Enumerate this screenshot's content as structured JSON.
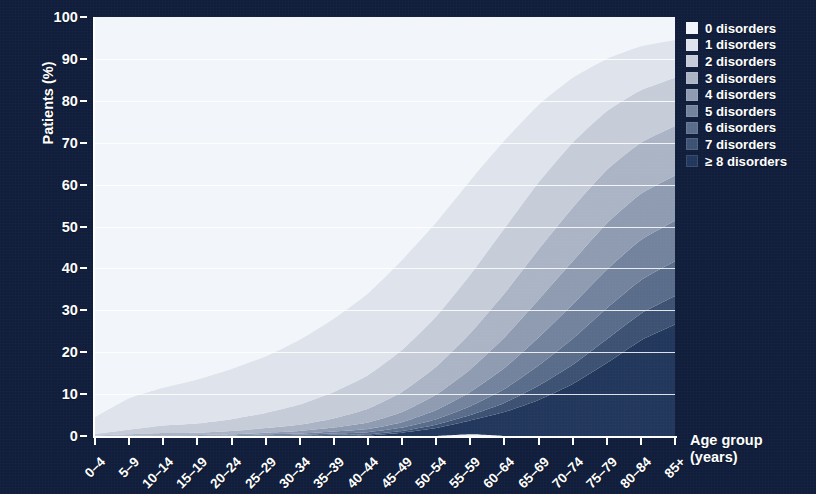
{
  "figure": {
    "background_color": "#101e3c",
    "plot_background": "#eef1f6",
    "axis_color": "#ffffff"
  },
  "axes": {
    "y_title": "Patients (%)",
    "x_title_line1": "Age group",
    "x_title_line2": "(years)",
    "y_ticks": [
      "0",
      "10",
      "20",
      "30",
      "40",
      "50",
      "60",
      "70",
      "80",
      "90",
      "100"
    ]
  },
  "legend": {
    "items": [
      {
        "label": "0 disorders",
        "color": "#f2f5f9"
      },
      {
        "label": "1 disorders",
        "color": "#dfe4ec"
      },
      {
        "label": "2 disorders",
        "color": "#c6ccd8"
      },
      {
        "label": "3 disorders",
        "color": "#aab4c5"
      },
      {
        "label": "4 disorders",
        "color": "#8e9bb1"
      },
      {
        "label": "5 disorders",
        "color": "#73839d"
      },
      {
        "label": "6 disorders",
        "color": "#596c8a"
      },
      {
        "label": "7 disorders",
        "color": "#3d5273"
      },
      {
        "label": "≥ 8 disorders",
        "color": "#22375c"
      }
    ]
  },
  "chart_data": {
    "type": "area",
    "stacked": true,
    "title": "",
    "xlabel": "Age group (years)",
    "ylabel": "Patients (%)",
    "ylim": [
      0,
      100
    ],
    "grid": true,
    "legend_position": "right",
    "categories": [
      "0–4",
      "5–9",
      "10–14",
      "15–19",
      "20–24",
      "25–29",
      "30–34",
      "35–39",
      "40–44",
      "45–49",
      "50–54",
      "55–59",
      "60–64",
      "65–69",
      "70–74",
      "75–79",
      "80–84",
      "85+"
    ],
    "series": [
      {
        "name": "0 disorders",
        "color": "#f2f5f9",
        "values": [
          95.5,
          91.0,
          88.5,
          86.5,
          84.0,
          81.0,
          77.0,
          72.0,
          66.0,
          58.0,
          49.0,
          39.0,
          29.5,
          21.0,
          14.5,
          10.0,
          7.0,
          5.5
        ]
      },
      {
        "name": "1 disorders",
        "color": "#dfe4ec",
        "values": [
          4.0,
          7.5,
          9.0,
          10.5,
          12.0,
          13.5,
          15.5,
          17.5,
          19.5,
          21.5,
          22.5,
          22.5,
          21.0,
          18.5,
          15.5,
          12.5,
          10.5,
          9.0
        ]
      },
      {
        "name": "2 disorders",
        "color": "#c6ccd8",
        "values": [
          0.4,
          1.1,
          1.8,
          2.2,
          2.8,
          3.6,
          4.8,
          6.3,
          8.0,
          10.0,
          12.0,
          14.0,
          15.5,
          16.0,
          15.5,
          14.0,
          12.5,
          11.5
        ]
      },
      {
        "name": "3 disorders",
        "color": "#aab4c5",
        "values": [
          0.1,
          0.3,
          0.5,
          0.6,
          0.8,
          1.1,
          1.5,
          2.2,
          3.3,
          4.8,
          6.6,
          8.6,
          10.5,
          12.0,
          12.8,
          12.8,
          12.2,
          11.8
        ]
      },
      {
        "name": "4 disorders",
        "color": "#8e9bb1",
        "values": [
          0.0,
          0.1,
          0.15,
          0.2,
          0.3,
          0.4,
          0.6,
          0.9,
          1.5,
          2.4,
          3.7,
          5.4,
          7.3,
          9.0,
          10.3,
          11.0,
          11.0,
          10.8
        ]
      },
      {
        "name": "5 disorders",
        "color": "#73839d",
        "values": [
          0.0,
          0.0,
          0.05,
          0.1,
          0.1,
          0.2,
          0.3,
          0.5,
          0.8,
          1.3,
          2.2,
          3.4,
          5.0,
          6.7,
          8.2,
          9.2,
          9.6,
          9.7
        ]
      },
      {
        "name": "6 disorders",
        "color": "#596c8a",
        "values": [
          0.0,
          0.0,
          0.0,
          0.0,
          0.0,
          0.1,
          0.15,
          0.3,
          0.5,
          0.8,
          1.3,
          2.1,
          3.3,
          4.8,
          6.2,
          7.4,
          8.0,
          8.3
        ]
      },
      {
        "name": "7 disorders",
        "color": "#3d5273",
        "values": [
          0.0,
          0.0,
          0.0,
          0.0,
          0.0,
          0.05,
          0.1,
          0.15,
          0.25,
          0.4,
          0.8,
          1.3,
          2.2,
          3.4,
          4.6,
          5.7,
          6.4,
          6.8
        ]
      },
      {
        "name": "≥ 8 disorders",
        "color": "#22375c",
        "values": [
          0.0,
          0.0,
          0.0,
          0.1,
          0.0,
          0.05,
          0.1,
          0.15,
          0.15,
          0.8,
          1.9,
          3.3,
          5.7,
          8.6,
          12.4,
          17.4,
          22.8,
          26.6
        ]
      }
    ]
  }
}
